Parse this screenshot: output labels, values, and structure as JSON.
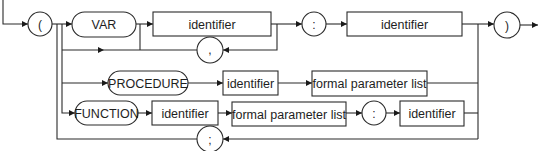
{
  "diagram": {
    "type": "syntax-railroad-diagram",
    "terminals": {
      "open_paren": "(",
      "close_paren": ")",
      "var_colon": ":",
      "comma": ",",
      "semicolon": ";",
      "func_colon": ":",
      "var": "VAR",
      "procedure": "PROCEDURE",
      "function": "FUNCTION"
    },
    "nonterminals": {
      "var_identifier": "identifier",
      "var_type_identifier": "identifier",
      "proc_identifier": "identifier",
      "proc_formal_list": "formal parameter list",
      "func_identifier": "identifier",
      "func_formal_list": "formal parameter list",
      "func_type_identifier": "identifier"
    },
    "colors": {
      "stroke": "#2a2a2a",
      "background": "#ffffff"
    }
  }
}
